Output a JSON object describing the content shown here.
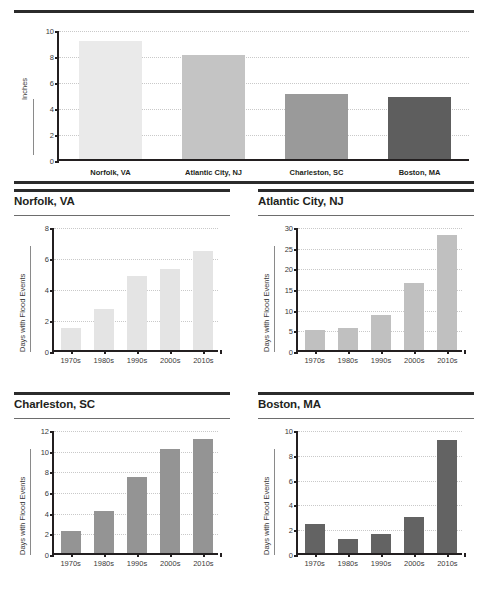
{
  "chart_data": [
    {
      "type": "bar",
      "id": "summary",
      "title": "",
      "xlabel": "",
      "ylabel": "Inches",
      "categories": [
        "Norfolk, VA",
        "Atlantic City, NJ",
        "Charleston, SC",
        "Boston, MA"
      ],
      "values": [
        9.1,
        8.0,
        5.0,
        4.8
      ],
      "colors": [
        "#eaeaea",
        "#c4c4c4",
        "#9a9a9a",
        "#5e5e5e"
      ],
      "ylim": [
        0,
        10
      ],
      "yticks": [
        0,
        2,
        4,
        6,
        8,
        10
      ],
      "grid": true,
      "legend": "none"
    },
    {
      "type": "bar",
      "id": "norfolk",
      "title": "Norfolk, VA",
      "xlabel": "",
      "ylabel": "Days with Flood Events",
      "categories": [
        "1970s",
        "1980s",
        "1990s",
        "2000s",
        "2010s"
      ],
      "values": [
        1.45,
        2.65,
        4.8,
        5.2,
        6.4
      ],
      "color": "#e4e4e4",
      "ylim": [
        0,
        8
      ],
      "yticks": [
        0,
        2,
        4,
        6,
        8
      ],
      "grid": true,
      "legend": "none"
    },
    {
      "type": "bar",
      "id": "atlantic-city",
      "title": "Atlantic City, NJ",
      "xlabel": "",
      "ylabel": "Days with Flood Events",
      "categories": [
        "1970s",
        "1980s",
        "1990s",
        "2000s",
        "2010s"
      ],
      "values": [
        4.8,
        5.4,
        8.4,
        16.2,
        27.9
      ],
      "color": "#c0c0c0",
      "ylim": [
        0,
        30
      ],
      "yticks": [
        0,
        5,
        10,
        15,
        20,
        25,
        30
      ],
      "grid": true,
      "legend": "none"
    },
    {
      "type": "bar",
      "id": "charleston",
      "title": "Charleston, SC",
      "xlabel": "",
      "ylabel": "Days with Flood Events",
      "categories": [
        "1970s",
        "1980s",
        "1990s",
        "2000s",
        "2010s"
      ],
      "values": [
        2.1,
        4.1,
        7.4,
        10.1,
        11.0
      ],
      "color": "#949494",
      "ylim": [
        0,
        12
      ],
      "yticks": [
        0,
        2,
        4,
        6,
        8,
        10,
        12
      ],
      "grid": true,
      "legend": "none"
    },
    {
      "type": "bar",
      "id": "boston",
      "title": "Boston, MA",
      "xlabel": "",
      "ylabel": "Days with Flood Events",
      "categories": [
        "1970s",
        "1980s",
        "1990s",
        "2000s",
        "2010s"
      ],
      "values": [
        2.3,
        1.1,
        1.5,
        2.9,
        9.1
      ],
      "color": "#636363",
      "ylim": [
        0,
        10
      ],
      "yticks": [
        0,
        2,
        4,
        6,
        8,
        10
      ],
      "grid": true,
      "legend": "none"
    }
  ]
}
